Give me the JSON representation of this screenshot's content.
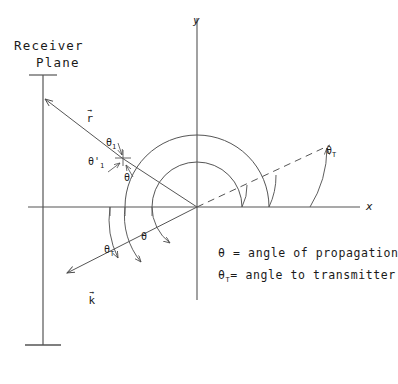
{
  "figure": {
    "axes": {
      "x_label": "x",
      "y_label": "y"
    },
    "receiver": {
      "line1": "Receiver",
      "line2": "Plane"
    },
    "vectors": {
      "r": {
        "symbol": "r",
        "accent": "arrow"
      },
      "k": {
        "symbol": "k",
        "accent": "arrow"
      }
    },
    "angles": {
      "theta1": {
        "base": "θ",
        "sub": "1"
      },
      "theta1_prime": {
        "base": "θ'",
        "sub": "1"
      },
      "theta_origin": {
        "base": "θ"
      },
      "theta_T_right": {
        "base": "θ",
        "sub": "T"
      },
      "theta_T_lower": {
        "base": "θ",
        "sub": "T"
      },
      "theta_lower": {
        "base": "θ"
      }
    },
    "legend": [
      {
        "symbol": "θ",
        "sub": "",
        "text": "= angle of propagation"
      },
      {
        "symbol": "θ",
        "sub": "T",
        "text": "= angle to transmitter"
      }
    ],
    "colors": {
      "ink": "#1a1a1a",
      "stroke": "#555555",
      "background": "#ffffff"
    }
  }
}
